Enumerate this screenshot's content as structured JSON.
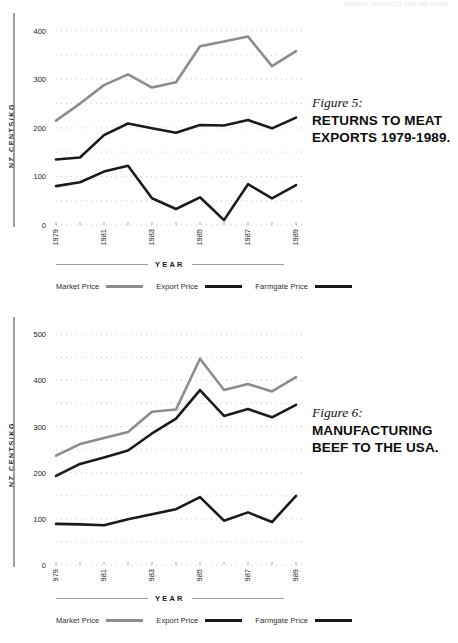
{
  "page": {
    "running_header": "PRIMARY PRODUCTS AND THE FIRMS"
  },
  "axis_title_y": "NZ CENTS/KG",
  "axis_title_x": "YEAR",
  "legend": [
    {
      "label": "Market Price",
      "color": "#8c8c8c"
    },
    {
      "label": "Export Price",
      "color": "#1a1a1a"
    },
    {
      "label": "Farmgate Price",
      "color": "#1a1a1a"
    }
  ],
  "figures": [
    {
      "figure_number": "Figure 5:",
      "title": "RETURNS TO MEAT EXPORTS 1979-1989."
    },
    {
      "figure_number": "Figure 6:",
      "title": "MANUFACTURING BEEF TO THE USA."
    }
  ],
  "chart_data": [
    {
      "type": "line",
      "title": "RETURNS TO MEAT EXPORTS 1979-1989.",
      "figure": "Figure 5:",
      "xlabel": "YEAR",
      "ylabel": "NZ CENTS/KG",
      "x": [
        1979,
        1979.5,
        1980,
        1980.5,
        1981,
        1981.5,
        1982,
        1982.5,
        1983,
        1983.5,
        1984,
        1984.5,
        1985,
        1985.5,
        1986,
        1986.5,
        1987,
        1987.5,
        1988,
        1988.5,
        1989
      ],
      "tick_labels": [
        "1979",
        "",
        "1981",
        "",
        "1983",
        "",
        "1985",
        "",
        "1987",
        "",
        "1989"
      ],
      "ylim": [
        0,
        420
      ],
      "yticks": [
        0,
        100,
        200,
        300,
        400
      ],
      "grid": "dotted-horizontal-every-50",
      "legend_position": "below-axis",
      "series": [
        {
          "name": "Market Price",
          "color": "#8c8c8c",
          "values": [
            215,
            250,
            288,
            310,
            283,
            294,
            368,
            378,
            388,
            327,
            358
          ]
        },
        {
          "name": "Export Price",
          "color": "#1a1a1a",
          "values": [
            135,
            139,
            185,
            209,
            199,
            190,
            206,
            205,
            216,
            199,
            221
          ]
        },
        {
          "name": "Farmgate Price",
          "color": "#1a1a1a",
          "values": [
            80,
            88,
            110,
            122,
            55,
            33,
            57,
            10,
            84,
            55,
            82
          ]
        }
      ]
    },
    {
      "type": "line",
      "title": "MANUFACTURING BEEF TO THE USA.",
      "figure": "Figure 6:",
      "xlabel": "YEAR",
      "ylabel": "NZ CENTS/KG",
      "x": [
        1979,
        1980,
        1981,
        1982,
        1983,
        1984,
        1985,
        1986,
        1987,
        1988,
        1989
      ],
      "tick_labels": [
        "1979",
        "",
        "1981",
        "",
        "1983",
        "",
        "1985",
        "",
        "1987",
        "",
        "1989"
      ],
      "ylim": [
        0,
        520
      ],
      "yticks": [
        0,
        100,
        200,
        300,
        400,
        500
      ],
      "grid": "dotted-horizontal-every-50",
      "legend_position": "below-axis",
      "series": [
        {
          "name": "Market Price",
          "color": "#8c8c8c",
          "values": [
            237,
            262,
            275,
            288,
            332,
            337,
            447,
            379,
            392,
            376,
            407
          ]
        },
        {
          "name": "Export Price",
          "color": "#1a1a1a",
          "values": [
            193,
            219,
            233,
            248,
            285,
            317,
            379,
            323,
            338,
            320,
            347
          ]
        },
        {
          "name": "Farmgate Price",
          "color": "#1a1a1a",
          "values": [
            89,
            88,
            86,
            99,
            110,
            121,
            147,
            96,
            114,
            93,
            150
          ]
        }
      ]
    }
  ]
}
